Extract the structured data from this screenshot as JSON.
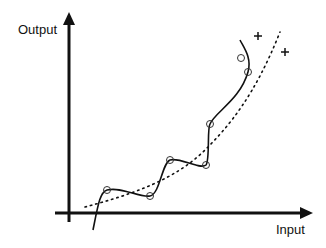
{
  "diagram": {
    "type": "curve-fitting-illustration",
    "y_axis_label": "Output",
    "x_axis_label": "Input",
    "colors": {
      "stroke": "#111111",
      "background": "#ffffff"
    },
    "data_points_circles": [
      {
        "x": 107,
        "y": 190
      },
      {
        "x": 150,
        "y": 196
      },
      {
        "x": 170,
        "y": 160
      },
      {
        "x": 206,
        "y": 165
      },
      {
        "x": 210,
        "y": 124
      },
      {
        "x": 248,
        "y": 72
      },
      {
        "x": 241,
        "y": 58
      }
    ],
    "test_points_plus": [
      {
        "x": 258,
        "y": 36
      },
      {
        "x": 285,
        "y": 52
      }
    ],
    "series": [
      {
        "name": "overfit-curve",
        "style": "solid"
      },
      {
        "name": "smooth-fit",
        "style": "dotted"
      }
    ]
  }
}
